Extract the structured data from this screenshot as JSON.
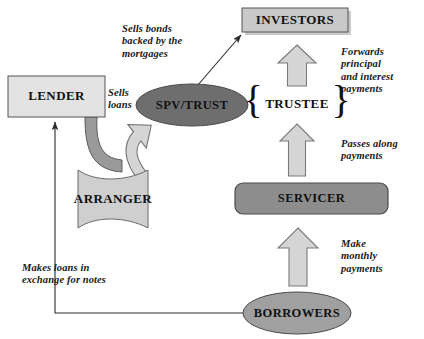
{
  "diagram": {
    "colors": {
      "box_fill_light": "#e3e3e3",
      "box_fill_investors": "#c9c9c9",
      "ellipse_fill_dark": "#6e6e6e",
      "ellipse_fill_mid": "#a0a0a0",
      "servicer_fill": "#8d8d8d",
      "arranger_fill": "#cfcfcf",
      "block_arrow_fill": "#d5d5d5",
      "curve_dark_fill": "#9a9a9a",
      "stroke": "#4a4a4a",
      "text": "#111111"
    },
    "nodes": [
      {
        "id": "lender",
        "label": "LENDER",
        "shape": "rect"
      },
      {
        "id": "investors",
        "label": "INVESTORS",
        "shape": "rect"
      },
      {
        "id": "spv",
        "label": "SPV/TRUST",
        "shape": "ellipse-dark"
      },
      {
        "id": "trustee",
        "label": "TRUSTEE",
        "shape": "braces"
      },
      {
        "id": "arranger",
        "label": "ARRANGER",
        "shape": "banner"
      },
      {
        "id": "servicer",
        "label": "SERVICER",
        "shape": "rounded-rect"
      },
      {
        "id": "borrowers",
        "label": "BORROWERS",
        "shape": "ellipse-mid"
      }
    ],
    "annotations": [
      {
        "id": "sells-bonds",
        "text": "Sells bonds\nbacked by the\nmortgages",
        "from": "spv",
        "to": "investors"
      },
      {
        "id": "sells-loans",
        "text": "Sells\nloans",
        "from": "lender",
        "to": "arranger"
      },
      {
        "id": "forwards",
        "text": "Forwards principal\nand interest\npayments",
        "from": "trustee",
        "to": "investors"
      },
      {
        "id": "passes-along",
        "text": "Passes along\npayments",
        "from": "servicer",
        "to": "trustee"
      },
      {
        "id": "make-monthly",
        "text": "Make\nmonthly\npayments",
        "from": "borrowers",
        "to": "servicer"
      },
      {
        "id": "makes-loans",
        "text": "Makes loans in\nexchange for notes",
        "from": "borrowers",
        "to": "lender"
      }
    ]
  }
}
